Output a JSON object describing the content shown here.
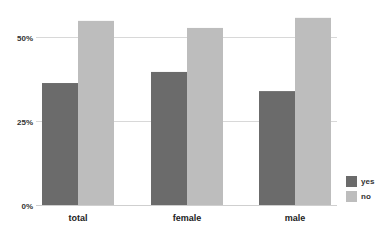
{
  "chart_data": {
    "type": "bar",
    "title": "",
    "xlabel": "",
    "ylabel": "",
    "categories": [
      "total",
      "female",
      "male"
    ],
    "series": [
      {
        "name": "yes",
        "color": "#6b6b6b",
        "values": [
          36.3,
          39.6,
          33.9
        ]
      },
      {
        "name": "no",
        "color": "#bdbdbd",
        "values": [
          54.8,
          52.7,
          55.7
        ]
      }
    ],
    "ylim": [
      0,
      55.7
    ],
    "yticks": [
      0,
      25,
      50
    ],
    "ytick_labels": [
      "0%",
      "25%",
      "50%"
    ],
    "grid": true,
    "legend_position": "right-bottom"
  }
}
